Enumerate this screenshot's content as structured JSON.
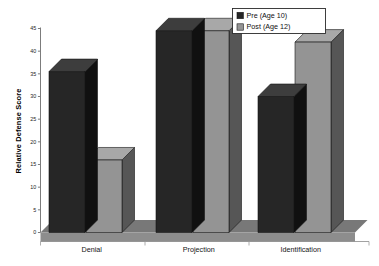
{
  "chart_data": {
    "type": "bar",
    "title": "",
    "subtitle": "",
    "xlabel": "",
    "ylabel": "Relative Defense Score",
    "categories": [
      "Denial",
      "Projection",
      "Identification"
    ],
    "series": [
      {
        "name": "Pre (Age 10)",
        "values": [
          35.5,
          44.5,
          30
        ],
        "color": "#262626"
      },
      {
        "name": "Post (Age 12)",
        "values": [
          16,
          44.5,
          42
        ],
        "color": "#949494"
      }
    ],
    "ylim": [
      0,
      45
    ],
    "yticks": [
      0,
      5,
      10,
      15,
      20,
      25,
      30,
      35,
      40,
      45
    ],
    "ytick_labels": [
      "0",
      "5",
      "10",
      "15",
      "20",
      "25",
      "30",
      "35",
      "40",
      "45"
    ],
    "grid": false,
    "legend_position": "top-right",
    "style": "3d-bar",
    "colors": {
      "pre_front": "#262626",
      "pre_top": "#3d3d3d",
      "pre_side": "#101010",
      "post_front": "#949494",
      "post_top": "#a8a8a8",
      "post_side": "#565656",
      "floor": "#787878",
      "floor_edge": "#8d8d8d",
      "background": "#ffffff",
      "axis": "#7c7c7c",
      "text": "#101010"
    }
  },
  "legend": {
    "items": [
      {
        "label": "Pre (Age 10)",
        "swatch": "#262626"
      },
      {
        "label": "Post (Age 12)",
        "swatch": "#949494"
      }
    ]
  },
  "axes": {
    "y_title": "Relative Defense Score",
    "y_tick_labels": [
      "45",
      "40",
      "35",
      "30",
      "25",
      "20",
      "15",
      "10",
      "5",
      "0"
    ],
    "x_tick_labels": [
      "Denial",
      "Projection",
      "Identification"
    ]
  }
}
